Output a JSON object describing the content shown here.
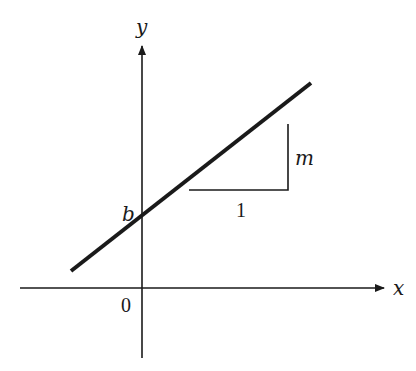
{
  "diagram": {
    "type": "slope-intercept line diagram",
    "axes": {
      "x_label": "x",
      "y_label": "y",
      "origin_label": "0"
    },
    "labels": {
      "intercept": "b",
      "slope_rise": "m",
      "slope_run": "1"
    },
    "colors": {
      "ink": "#1a1a1a",
      "background": "#ffffff"
    }
  }
}
